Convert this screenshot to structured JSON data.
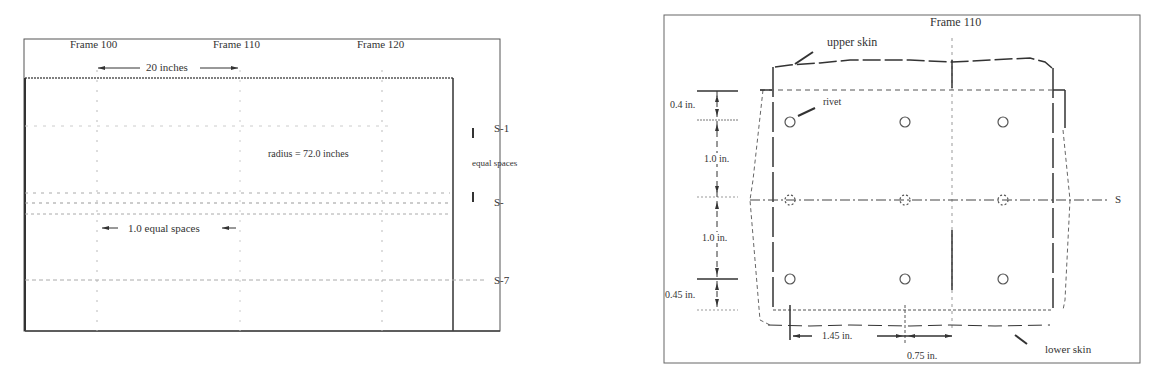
{
  "left_diagram": {
    "frames": [
      "Frame 100",
      "Frame 110",
      "Frame 120"
    ],
    "frame_spacing": "20 inches",
    "radius_label": "radius = 72.0 inches",
    "rivet_spacing": "1.0 equal spaces",
    "stringers": [
      "S-1",
      "S-",
      "S-7"
    ],
    "stringer_spacing": "equal spaces"
  },
  "right_diagram": {
    "frame_label": "Frame 110",
    "upper_skin": "upper skin",
    "lower_skin": "lower skin",
    "rivet": "rivet",
    "stringer": "S",
    "dims_vertical": [
      "0.4 in.",
      "1.0 in.",
      "1.0 in.",
      "0.45 in."
    ],
    "dim_horizontal_1": "1.45 in.",
    "dim_horizontal_2": "0.75 in."
  },
  "colors": {
    "line": "#333333",
    "faint": "#999999"
  }
}
